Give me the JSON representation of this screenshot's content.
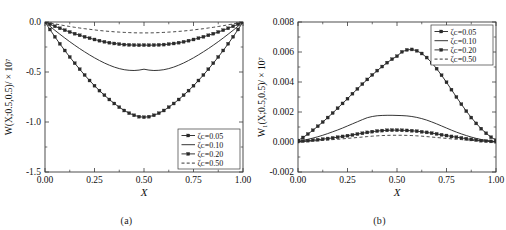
{
  "figure": {
    "panel_a_caption": "(a)",
    "panel_b_caption": "(b)",
    "axis_color": "#3a3a3a",
    "curve_color": "#2b2b2b"
  },
  "chart_data": [
    {
      "type": "line",
      "panel": "a",
      "title": "",
      "xlabel": "X",
      "ylabel": "W(X;0.5,0.5)/ × 10⁷",
      "xlim": [
        0.0,
        1.0
      ],
      "ylim": [
        -1.5,
        0.0
      ],
      "xticks": [
        "0.00",
        "0.25",
        "0.50",
        "0.75",
        "1.00"
      ],
      "xtick_values": [
        0.0,
        0.25,
        0.5,
        0.75,
        1.0
      ],
      "yticks": [
        "0.0",
        "-0.5",
        "-1.0",
        "-1.5"
      ],
      "ytick_values": [
        0.0,
        -0.5,
        -1.0,
        -1.5
      ],
      "grid": false,
      "legend_position": "lower-right",
      "x": [
        0.0,
        0.025,
        0.05,
        0.075,
        0.1,
        0.125,
        0.15,
        0.175,
        0.2,
        0.225,
        0.25,
        0.275,
        0.3,
        0.325,
        0.35,
        0.375,
        0.4,
        0.425,
        0.45,
        0.475,
        0.5,
        0.525,
        0.55,
        0.575,
        0.6,
        0.625,
        0.65,
        0.675,
        0.7,
        0.725,
        0.75,
        0.775,
        0.8,
        0.825,
        0.85,
        0.875,
        0.9,
        0.925,
        0.95,
        0.975,
        1.0
      ],
      "series": [
        {
          "name": "ζᴄ=0.05",
          "style": "line-marker",
          "marker": "square",
          "values": [
            0.0,
            -0.075,
            -0.148,
            -0.218,
            -0.285,
            -0.35,
            -0.412,
            -0.472,
            -0.53,
            -0.585,
            -0.637,
            -0.686,
            -0.732,
            -0.775,
            -0.815,
            -0.852,
            -0.885,
            -0.912,
            -0.933,
            -0.947,
            -0.952,
            -0.947,
            -0.933,
            -0.912,
            -0.885,
            -0.852,
            -0.815,
            -0.775,
            -0.732,
            -0.686,
            -0.637,
            -0.585,
            -0.53,
            -0.472,
            -0.412,
            -0.35,
            -0.285,
            -0.218,
            -0.148,
            -0.075,
            0.0
          ]
        },
        {
          "name": "ζᴄ=0.10",
          "style": "solid",
          "marker": "none",
          "values": [
            0.0,
            -0.042,
            -0.083,
            -0.122,
            -0.16,
            -0.197,
            -0.232,
            -0.266,
            -0.298,
            -0.329,
            -0.358,
            -0.385,
            -0.41,
            -0.432,
            -0.451,
            -0.466,
            -0.477,
            -0.483,
            -0.485,
            -0.481,
            -0.472,
            -0.481,
            -0.485,
            -0.483,
            -0.477,
            -0.466,
            -0.451,
            -0.432,
            -0.41,
            -0.385,
            -0.358,
            -0.329,
            -0.298,
            -0.266,
            -0.232,
            -0.197,
            -0.16,
            -0.122,
            -0.083,
            -0.042,
            0.0
          ]
        },
        {
          "name": "ζᴄ=0.20",
          "style": "line-marker",
          "marker": "square",
          "values": [
            0.0,
            -0.022,
            -0.043,
            -0.063,
            -0.082,
            -0.1,
            -0.117,
            -0.133,
            -0.148,
            -0.162,
            -0.175,
            -0.187,
            -0.198,
            -0.207,
            -0.215,
            -0.221,
            -0.226,
            -0.229,
            -0.231,
            -0.232,
            -0.231,
            -0.232,
            -0.231,
            -0.229,
            -0.226,
            -0.221,
            -0.215,
            -0.207,
            -0.198,
            -0.187,
            -0.175,
            -0.162,
            -0.148,
            -0.133,
            -0.117,
            -0.1,
            -0.082,
            -0.063,
            -0.043,
            -0.022,
            0.0
          ]
        },
        {
          "name": "ζᴄ=0.50",
          "style": "dashed",
          "marker": "none",
          "values": [
            0.0,
            -0.01,
            -0.019,
            -0.028,
            -0.037,
            -0.045,
            -0.053,
            -0.06,
            -0.067,
            -0.073,
            -0.079,
            -0.085,
            -0.09,
            -0.094,
            -0.098,
            -0.101,
            -0.104,
            -0.106,
            -0.108,
            -0.109,
            -0.109,
            -0.109,
            -0.108,
            -0.106,
            -0.104,
            -0.101,
            -0.098,
            -0.094,
            -0.09,
            -0.085,
            -0.079,
            -0.073,
            -0.067,
            -0.06,
            -0.053,
            -0.045,
            -0.037,
            -0.028,
            -0.019,
            -0.01,
            0.0
          ]
        }
      ]
    },
    {
      "type": "line",
      "panel": "b",
      "title": "",
      "xlabel": "X",
      "ylabel": "W₁(X;0.5,0.5)/ × 10⁷",
      "xlim": [
        0.0,
        1.0
      ],
      "ylim": [
        -0.002,
        0.008
      ],
      "xticks": [
        "0.00",
        "0.25",
        "0.50",
        "0.75",
        "1.00"
      ],
      "xtick_values": [
        0.0,
        0.25,
        0.5,
        0.75,
        1.0
      ],
      "yticks": [
        "0.008",
        "0.006",
        "0.004",
        "0.002",
        "0.000",
        "-0.002"
      ],
      "ytick_values": [
        0.008,
        0.006,
        0.004,
        0.002,
        0.0,
        -0.002
      ],
      "grid": false,
      "legend_position": "upper-right",
      "x": [
        0.0,
        0.025,
        0.05,
        0.075,
        0.1,
        0.125,
        0.15,
        0.175,
        0.2,
        0.225,
        0.25,
        0.275,
        0.3,
        0.325,
        0.35,
        0.375,
        0.4,
        0.425,
        0.45,
        0.475,
        0.5,
        0.525,
        0.55,
        0.575,
        0.6,
        0.625,
        0.65,
        0.675,
        0.7,
        0.725,
        0.75,
        0.775,
        0.8,
        0.825,
        0.85,
        0.875,
        0.9,
        0.925,
        0.95,
        0.975,
        1.0
      ],
      "series": [
        {
          "name": "ζᴄ=0.05",
          "style": "line-marker",
          "marker": "square",
          "values": [
            0.0001,
            0.0003,
            0.00053,
            0.00078,
            0.00105,
            0.00133,
            0.00163,
            0.00193,
            0.00225,
            0.00257,
            0.00289,
            0.00322,
            0.00354,
            0.00386,
            0.00417,
            0.00447,
            0.00476,
            0.00503,
            0.00529,
            0.00552,
            0.00572,
            0.00601,
            0.00614,
            0.00617,
            0.00608,
            0.0059,
            0.00563,
            0.00529,
            0.00489,
            0.00445,
            0.00398,
            0.00349,
            0.003,
            0.00252,
            0.00206,
            0.00163,
            0.00124,
            0.00089,
            0.00058,
            0.00032,
            0.00012
          ]
        },
        {
          "name": "ζᴄ=0.10",
          "style": "solid",
          "marker": "none",
          "values": [
            5e-05,
            0.00011,
            0.00018,
            0.00026,
            0.00035,
            0.00045,
            0.00056,
            0.00068,
            0.0008,
            0.00093,
            0.00107,
            0.00121,
            0.00135,
            0.00149,
            0.00162,
            0.0017,
            0.00175,
            0.00177,
            0.00178,
            0.00178,
            0.00177,
            0.00176,
            0.00174,
            0.0017,
            0.00164,
            0.00156,
            0.00146,
            0.00134,
            0.00121,
            0.00107,
            0.00093,
            0.00079,
            0.00066,
            0.00054,
            0.00043,
            0.00033,
            0.00024,
            0.00017,
            0.00011,
            6e-05,
            3e-05
          ]
        },
        {
          "name": "ζᴄ=0.20",
          "style": "line-marker",
          "marker": "square",
          "values": [
            3e-05,
            6e-05,
            9e-05,
            0.00012,
            0.00015,
            0.00019,
            0.00023,
            0.00027,
            0.00032,
            0.00037,
            0.00042,
            0.00047,
            0.00053,
            0.00058,
            0.00064,
            0.00069,
            0.00073,
            0.00076,
            0.00078,
            0.00079,
            0.00079,
            0.00078,
            0.00077,
            0.00075,
            0.00072,
            0.00068,
            0.00064,
            0.00059,
            0.00054,
            0.00048,
            0.00043,
            0.00037,
            0.00032,
            0.00027,
            0.00022,
            0.00017,
            0.00013,
            9e-05,
            6e-05,
            4e-05,
            2e-05
          ]
        },
        {
          "name": "ζᴄ=0.50",
          "style": "dashed",
          "marker": "none",
          "values": [
            2e-05,
            3e-05,
            5e-05,
            7e-05,
            9e-05,
            0.00011,
            0.00013,
            0.00016,
            0.00018,
            0.00021,
            0.00024,
            0.00027,
            0.0003,
            0.00033,
            0.00036,
            0.00039,
            0.00041,
            0.00043,
            0.00044,
            0.00045,
            0.00045,
            0.00045,
            0.00044,
            0.00043,
            0.00041,
            0.00039,
            0.00036,
            0.00033,
            0.0003,
            0.00027,
            0.00024,
            0.00021,
            0.00018,
            0.00016,
            0.00013,
            0.00011,
            9e-05,
            7e-05,
            5e-05,
            3e-05,
            2e-05
          ]
        }
      ]
    }
  ]
}
